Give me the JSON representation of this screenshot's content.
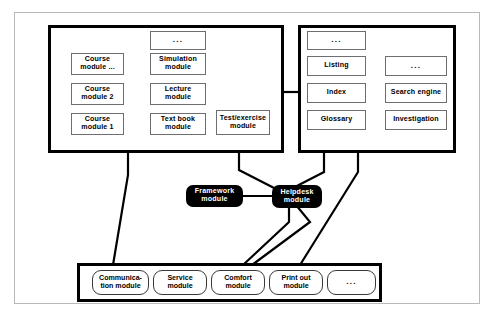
{
  "diagram": {
    "colors": {
      "background": "#ffffff",
      "panel_border": "#000000",
      "box_border": "#6e6e6e",
      "highlight_fill": "#000000",
      "highlight_text": "#ffffff",
      "outer_frame": "#b9b9b9"
    },
    "ellipsis": "...",
    "panels": {
      "course_panel": {
        "name": "course-content-panel",
        "course_modules": [
          {
            "line1": "Course",
            "line2": "module ..."
          },
          {
            "line1": "Course",
            "line2": "module 2"
          },
          {
            "line1": "Course",
            "line2": "module 1"
          }
        ],
        "content_modules": [
          {
            "line1": "...",
            "line2": ""
          },
          {
            "line1": "Simulation",
            "line2": "module"
          },
          {
            "line1": "Lecture",
            "line2": "module"
          },
          {
            "line1": "Text book",
            "line2": "module"
          }
        ],
        "extra_modules": [
          {
            "line1": "Test/exercise",
            "line2": "module"
          }
        ]
      },
      "reference_panel": {
        "name": "reference-tools-panel",
        "left_column": [
          {
            "line1": "...",
            "line2": ""
          },
          {
            "line1": "Listing",
            "line2": ""
          },
          {
            "line1": "Index",
            "line2": ""
          },
          {
            "line1": "Glossary",
            "line2": ""
          }
        ],
        "right_column": [
          {
            "line1": "...",
            "line2": ""
          },
          {
            "line1": "Search engine",
            "line2": ""
          },
          {
            "line1": "Investigation",
            "line2": ""
          }
        ]
      },
      "service_panel": {
        "name": "service-modules-panel",
        "modules": [
          {
            "line1": "Communica-",
            "line2": "tion module"
          },
          {
            "line1": "Service",
            "line2": "module"
          },
          {
            "line1": "Comfort",
            "line2": "module"
          },
          {
            "line1": "Print out",
            "line2": "module"
          },
          {
            "line1": "...",
            "line2": ""
          }
        ]
      }
    },
    "core_modules": [
      {
        "name": "framework-module",
        "line1": "Framework",
        "line2": "module"
      },
      {
        "name": "helpdesk-module",
        "line1": "Helpdesk",
        "line2": "module"
      }
    ]
  }
}
